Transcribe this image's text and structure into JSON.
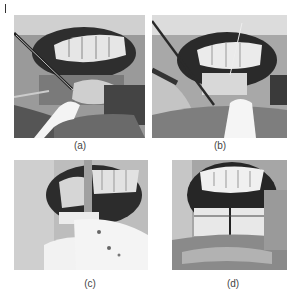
{
  "figure": {
    "panels": [
      {
        "id": "a",
        "label": "(a)",
        "description": "Intraoral surgical view, lower lip retracted, forceps and suction at mandibular vestibule"
      },
      {
        "id": "b",
        "label": "(b)",
        "description": "Intraoral view with instruments at lower anterior vestibule, incision area"
      },
      {
        "id": "c",
        "label": "(c)",
        "description": "Exposed mandibular anterior region with retractor and gauze"
      },
      {
        "id": "d",
        "label": "(d)",
        "description": "Exposed mandibular bone with vertical cut line below lower incisors"
      }
    ]
  }
}
